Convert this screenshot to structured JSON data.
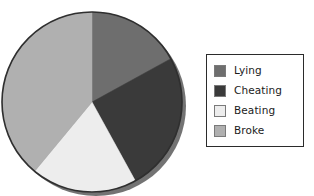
{
  "chart_data": {
    "type": "pie",
    "title": "",
    "categories": [
      "Lying",
      "Cheating",
      "Beating",
      "Broke"
    ],
    "values": [
      17,
      25,
      19,
      39
    ],
    "value_unit": "percent",
    "colors": [
      "#6e6e6e",
      "#3a3a3a",
      "#ededed",
      "#b0b0b0"
    ],
    "start_angle_deg": 0,
    "direction": "clockwise",
    "slice_angles_deg": [
      61,
      91,
      69,
      139
    ],
    "legend": {
      "position": "right",
      "bordered": true,
      "entries": [
        {
          "label": "Lying",
          "color": "#6e6e6e",
          "swatch_border": "#7a7a7a"
        },
        {
          "label": "Cheating",
          "color": "#3a3a3a",
          "swatch_border": "#7a7a7a"
        },
        {
          "label": "Beating",
          "color": "#ededed",
          "swatch_border": "#7a7a7a"
        },
        {
          "label": "Broke",
          "color": "#b0b0b0",
          "swatch_border": "#7a7a7a"
        }
      ]
    },
    "xlabel": "",
    "ylabel": "",
    "grid": false,
    "has_drop_shadow": true,
    "shadow_color": "#555555",
    "outline_color": "#2f2f2f",
    "background": "#ffffff"
  }
}
